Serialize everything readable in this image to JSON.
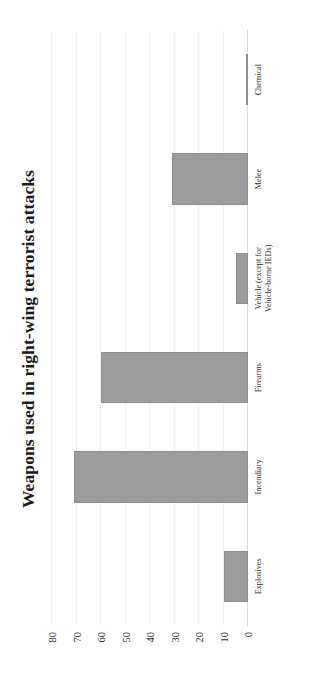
{
  "chart_data": {
    "type": "bar",
    "title": "Weapons used in right-wing terrorist attacks",
    "xlabel": "",
    "ylabel": "",
    "orientation": "vertical",
    "categories": [
      "Explosives",
      "Incendiary",
      "Firearms",
      "Vehicle (except for\nVehicle-borne IEDs)",
      "Melee",
      "Chemical"
    ],
    "values": [
      10,
      71,
      60,
      5,
      31,
      1
    ],
    "ylim": [
      0,
      80
    ],
    "yticks": [
      0,
      10,
      20,
      30,
      40,
      50,
      60,
      70,
      80
    ],
    "ytick_labels": [
      "0",
      "10",
      "20",
      "30",
      "40",
      "50",
      "60",
      "70",
      "80"
    ],
    "grid": true,
    "legend": false,
    "bar_color": "#9c9c9c",
    "gridline_color": "#f2f2f2",
    "axis_color": "#d9d9d9",
    "text_color": "#2b2b2b"
  },
  "figure": {
    "rotation_note": "90",
    "background": "#ffffff",
    "border_color": "#e8e8e8"
  }
}
